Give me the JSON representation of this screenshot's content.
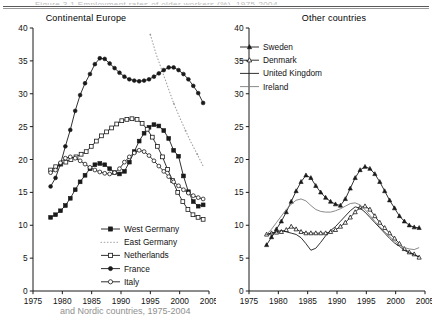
{
  "figure": {
    "top_cut_text": "Figure 3.1 Employment rates of older workers (%), 1975-2004",
    "bottom_cut_text": "and Nordic countries, 1975-2004",
    "axis_color": "#1a1a1a",
    "dotted_color": "#9d9d9d",
    "thin_color": "#7d7d7d"
  },
  "axes": {
    "y_ticks": [
      "0",
      "5",
      "10",
      "15",
      "20",
      "25",
      "30",
      "35",
      "40"
    ],
    "x_ticks": [
      "1975",
      "1980",
      "1985",
      "1990",
      "1995",
      "2000",
      "2005"
    ],
    "ylim": [
      0,
      40
    ],
    "xlim": [
      1975,
      2005
    ]
  },
  "chart_data": [
    {
      "type": "line",
      "title": "Continental Europe",
      "xlabel": "",
      "ylabel": "",
      "ylim": [
        0,
        40
      ],
      "xlim": [
        1975,
        2005
      ],
      "grid": false,
      "legend_position": "bottom-center",
      "x": [
        1978,
        1979,
        1980,
        1981,
        1982,
        1983,
        1984,
        1985,
        1986,
        1987,
        1988,
        1989,
        1990,
        1991,
        1992,
        1993,
        1994,
        1995,
        1996,
        1997,
        1998,
        1999,
        2000,
        2001,
        2002,
        2003,
        2004
      ],
      "series": [
        {
          "name": "West Germany",
          "marker": "filled-square",
          "values": [
            11.2,
            11.6,
            12.2,
            13.0,
            14.1,
            15.4,
            16.6,
            17.6,
            18.6,
            19.2,
            19.4,
            19.2,
            18.6,
            18.0,
            17.8,
            18.2,
            19.6,
            21.2,
            22.8,
            24.0,
            24.9,
            25.3,
            25.1,
            24.4,
            23.2,
            21.4,
            20.5,
            17.5,
            15.1,
            13.6,
            12.9,
            13.1
          ]
        },
        {
          "name": "East Germany",
          "marker": "none-dotted",
          "values": [
            null,
            null,
            null,
            null,
            null,
            null,
            null,
            null,
            null,
            null,
            null,
            null,
            null,
            null,
            null,
            null,
            null,
            39.0,
            36.0,
            33.5,
            31.0,
            28.5,
            26.4,
            24.4,
            22.5,
            20.8,
            19.0
          ]
        },
        {
          "name": "Netherlands",
          "marker": "open-square",
          "values": [
            18.4,
            18.9,
            19.3,
            19.6,
            20.0,
            20.4,
            20.8,
            21.2,
            22.0,
            22.8,
            23.6,
            24.2,
            24.8,
            25.4,
            25.9,
            26.1,
            26.2,
            26.1,
            25.5,
            24.6,
            23.4,
            22.0,
            20.4,
            18.5,
            16.8,
            15.0,
            13.6,
            12.4,
            11.6,
            11.2,
            10.9
          ]
        },
        {
          "name": "France",
          "marker": "filled-circle",
          "values": [
            15.9,
            17.2,
            19.3,
            22.0,
            24.5,
            27.4,
            29.8,
            31.6,
            33.0,
            34.5,
            35.4,
            35.3,
            34.6,
            33.9,
            33.2,
            32.6,
            32.2,
            32.0,
            31.9,
            32.0,
            32.2,
            32.6,
            33.1,
            33.6,
            34.0,
            34.0,
            33.6,
            33.0,
            32.2,
            31.2,
            30.1,
            28.6
          ]
        },
        {
          "name": "Italy",
          "marker": "open-circle",
          "values": [
            18.0,
            18.4,
            19.5,
            20.2,
            20.4,
            20.2,
            19.8,
            19.3,
            18.8,
            18.4,
            18.1,
            17.9,
            17.8,
            18.0,
            18.6,
            19.6,
            20.4,
            21.0,
            21.4,
            21.2,
            20.6,
            19.8,
            19.0,
            18.2,
            17.4,
            16.6,
            16.0,
            15.4,
            14.9,
            14.5,
            14.2,
            14.0
          ]
        }
      ]
    },
    {
      "type": "line",
      "title": "Other countries",
      "xlabel": "",
      "ylabel": "",
      "ylim": [
        0,
        40
      ],
      "xlim": [
        1975,
        2005
      ],
      "grid": false,
      "legend_position": "top-left",
      "x": [
        1978,
        1979,
        1980,
        1981,
        1982,
        1983,
        1984,
        1985,
        1986,
        1987,
        1988,
        1989,
        1990,
        1991,
        1992,
        1993,
        1994,
        1995,
        1996,
        1997,
        1998,
        1999,
        2000,
        2001,
        2002,
        2003,
        2004
      ],
      "series": [
        {
          "name": "Sweden",
          "marker": "filled-triangle",
          "values": [
            7.0,
            8.2,
            9.4,
            10.6,
            12.0,
            13.6,
            15.2,
            16.6,
            17.6,
            17.2,
            16.0,
            15.0,
            14.2,
            13.6,
            13.2,
            13.0,
            14.0,
            15.6,
            17.2,
            18.4,
            18.9,
            18.6,
            17.8,
            16.6,
            15.2,
            13.8,
            12.6,
            11.4,
            10.6,
            10.0,
            9.7,
            9.6
          ]
        },
        {
          "name": "Denmark",
          "marker": "open-triangle",
          "values": [
            8.6,
            8.8,
            8.9,
            9.0,
            9.3,
            9.8,
            9.4,
            9.0,
            8.8,
            8.8,
            8.8,
            8.8,
            8.8,
            9.0,
            9.3,
            9.8,
            10.4,
            11.2,
            12.0,
            12.7,
            12.9,
            12.4,
            11.4,
            10.4,
            9.6,
            8.8,
            8.0,
            7.2,
            6.4,
            5.9,
            5.6,
            5.1
          ]
        },
        {
          "name": "United Kingdom",
          "marker": "line",
          "values": [
            8.6,
            8.8,
            9.0,
            9.2,
            9.0,
            8.8,
            8.6,
            8.1,
            7.2,
            6.2,
            6.5,
            7.4,
            8.4,
            9.2,
            9.8,
            10.6,
            11.4,
            12.2,
            12.8,
            12.6,
            12.0,
            11.2,
            10.4,
            9.6,
            8.8,
            8.0,
            7.3,
            6.8,
            6.2,
            5.8,
            5.5,
            5.2
          ]
        },
        {
          "name": "Ireland",
          "marker": "thin-line",
          "values": [
            8.6,
            9.4,
            10.4,
            11.4,
            12.4,
            13.2,
            13.8,
            14.0,
            13.7,
            13.0,
            12.4,
            12.1,
            12.0,
            12.0,
            12.2,
            12.5,
            12.9,
            13.3,
            13.4,
            13.1,
            12.4,
            11.5,
            10.6,
            9.8,
            9.0,
            8.3,
            7.6,
            7.0,
            6.6,
            6.4,
            6.3,
            6.6
          ]
        }
      ]
    }
  ],
  "panels": [
    {
      "id": "continental-europe",
      "title": "Continental Europe",
      "legend": [
        {
          "label": "West Germany",
          "marker": "filled-square"
        },
        {
          "label": "East Germany",
          "marker": "dotted-line"
        },
        {
          "label": "Netherlands",
          "marker": "open-square"
        },
        {
          "label": "France",
          "marker": "filled-circle"
        },
        {
          "label": "Italy",
          "marker": "open-circle"
        }
      ]
    },
    {
      "id": "other-countries",
      "title": "Other countries",
      "legend": [
        {
          "label": "Sweden",
          "marker": "filled-triangle"
        },
        {
          "label": "Denmark",
          "marker": "open-triangle"
        },
        {
          "label": "United Kingdom",
          "marker": "solid-line"
        },
        {
          "label": "Ireland",
          "marker": "thin-line"
        }
      ]
    }
  ]
}
